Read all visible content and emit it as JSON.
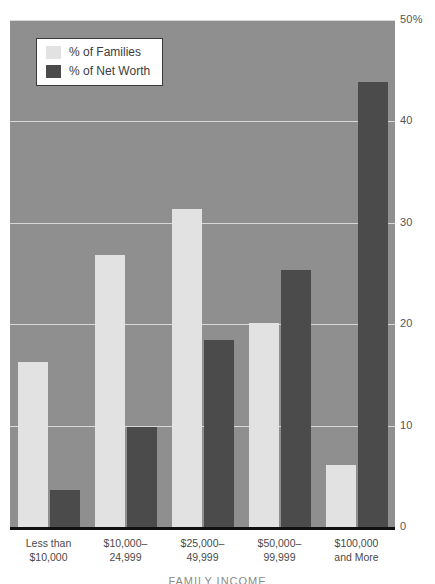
{
  "chart_data": {
    "type": "bar",
    "title": "",
    "xlabel": "FAMILY INCOME",
    "ylabel": "",
    "ylim": [
      0,
      50
    ],
    "yticks": [
      0,
      10,
      20,
      30,
      40,
      50
    ],
    "ytick_labels": [
      "0",
      "10",
      "20",
      "30",
      "40",
      "50%"
    ],
    "grid": true,
    "legend_position": "top-left",
    "categories": [
      "Less than $10,000",
      "$10,000–24,999",
      "$25,000–49,999",
      "$50,000–99,999",
      "$100,000 and More"
    ],
    "series": [
      {
        "name": "% of Families",
        "color": "#e2e2e2",
        "values": [
          16.3,
          26.8,
          31.3,
          20.1,
          6.1
        ]
      },
      {
        "name": "% of Net Worth",
        "color": "#4b4b4b",
        "values": [
          3.6,
          9.9,
          18.4,
          25.3,
          43.8
        ]
      }
    ]
  },
  "legend": {
    "items": [
      {
        "label": "% of Families",
        "swatch": "families"
      },
      {
        "label": "% of Net Worth",
        "swatch": "networth"
      }
    ]
  },
  "y_axis": {
    "ticks": [
      {
        "label": "50%",
        "value": 50
      },
      {
        "label": "40",
        "value": 40
      },
      {
        "label": "30",
        "value": 30
      },
      {
        "label": "20",
        "value": 20
      },
      {
        "label": "10",
        "value": 10
      },
      {
        "label": "0",
        "value": 0
      }
    ]
  },
  "x_axis": {
    "title": "FAMILY INCOME",
    "categories": [
      {
        "line1": "Less than",
        "line2": "$10,000"
      },
      {
        "line1": "$10,000–",
        "line2": "24,999"
      },
      {
        "line1": "$25,000–",
        "line2": "49,999"
      },
      {
        "line1": "$50,000–",
        "line2": "99,999"
      },
      {
        "line1": "$100,000",
        "line2": "and More"
      }
    ]
  },
  "colors": {
    "plot_background": "#8f8f8f",
    "gridline": "#d8d8d8",
    "axis_line": "#111111",
    "families": "#e2e2e2",
    "networth": "#4b4b4b",
    "legend_background": "#ffffff",
    "legend_border": "#3a3a3a"
  }
}
